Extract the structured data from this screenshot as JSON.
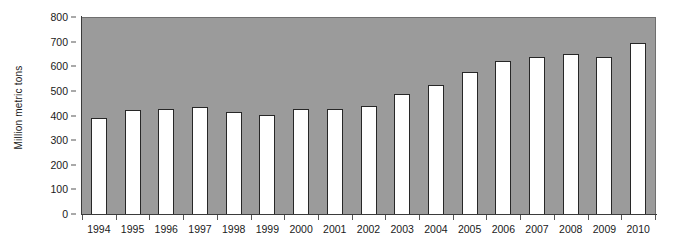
{
  "chart_data": {
    "type": "bar",
    "title": "",
    "subtitle": "",
    "xlabel": "",
    "ylabel": "Million metric tons",
    "ylim": [
      0,
      800
    ],
    "ytick_step": 100,
    "yticks": [
      "0",
      "100",
      "200",
      "300",
      "400",
      "500",
      "600",
      "700",
      "800"
    ],
    "grid": false,
    "legend": null,
    "legend_position": "none",
    "categories": [
      "1994",
      "1995",
      "1996",
      "1997",
      "1998",
      "1999",
      "2000",
      "2001",
      "2002",
      "2003",
      "2004",
      "2005",
      "2006",
      "2007",
      "2008",
      "2009",
      "2010"
    ],
    "values": [
      392,
      425,
      430,
      437,
      420,
      408,
      430,
      432,
      443,
      490,
      530,
      580,
      625,
      643,
      655,
      640,
      700
    ],
    "colors": {
      "plot_background": "#9b9b9b",
      "bar_fill": "#ffffff",
      "bar_border": "#272727",
      "axis": "#3b3b3b",
      "text": "#1a1a1a",
      "page_background": "#ffffff"
    }
  }
}
